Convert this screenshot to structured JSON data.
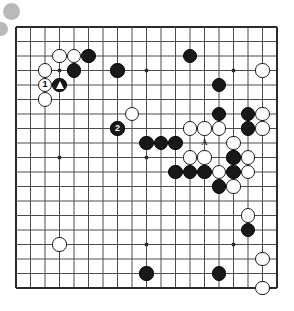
{
  "board": {
    "name": "go-board",
    "size": 19,
    "origin_x": 16,
    "origin_y": 27,
    "spacing": 14.5,
    "line_color": "#4c4c4c",
    "border_color": "#2b2b2b",
    "background_color": "#ffffff",
    "star_points": [
      [
        4,
        4
      ],
      [
        10,
        4
      ],
      [
        16,
        4
      ],
      [
        4,
        10
      ],
      [
        10,
        10
      ],
      [
        16,
        10
      ],
      [
        4,
        16
      ],
      [
        10,
        16
      ],
      [
        16,
        16
      ]
    ]
  },
  "decor": {
    "blob_color": "#b9b9b9",
    "blobs": [
      {
        "name": "decor-circle-1"
      },
      {
        "name": "decor-circle-2"
      }
    ]
  },
  "stones": [
    {
      "color": "white",
      "col": 4,
      "row": 3,
      "label": ""
    },
    {
      "color": "white",
      "col": 5,
      "row": 3,
      "label": ""
    },
    {
      "color": "black",
      "col": 6,
      "row": 3,
      "label": ""
    },
    {
      "color": "black",
      "col": 13,
      "row": 3,
      "label": ""
    },
    {
      "color": "white",
      "col": 3,
      "row": 4,
      "label": ""
    },
    {
      "color": "black",
      "col": 5,
      "row": 4,
      "label": ""
    },
    {
      "color": "black",
      "col": 8,
      "row": 4,
      "label": ""
    },
    {
      "color": "black",
      "col": 15,
      "row": 5,
      "label": ""
    },
    {
      "color": "white",
      "col": 18,
      "row": 4,
      "label": ""
    },
    {
      "color": "white",
      "col": 3,
      "row": 5,
      "label": "1"
    },
    {
      "color": "black",
      "col": 4,
      "row": 5,
      "label": "",
      "mark": "triangle"
    },
    {
      "color": "white",
      "col": 3,
      "row": 6,
      "label": ""
    },
    {
      "color": "white",
      "col": 9,
      "row": 7,
      "label": ""
    },
    {
      "color": "black",
      "col": 15,
      "row": 7,
      "label": ""
    },
    {
      "color": "black",
      "col": 17,
      "row": 7,
      "label": ""
    },
    {
      "color": "white",
      "col": 18,
      "row": 7,
      "label": ""
    },
    {
      "color": "black",
      "col": 8,
      "row": 8,
      "label": "2"
    },
    {
      "color": "white",
      "col": 13,
      "row": 8,
      "label": ""
    },
    {
      "color": "white",
      "col": 14,
      "row": 8,
      "label": ""
    },
    {
      "color": "white",
      "col": 15,
      "row": 8,
      "label": ""
    },
    {
      "color": "black",
      "col": 17,
      "row": 8,
      "label": ""
    },
    {
      "color": "white",
      "col": 18,
      "row": 8,
      "label": ""
    },
    {
      "color": "black",
      "col": 10,
      "row": 9,
      "label": ""
    },
    {
      "color": "black",
      "col": 11,
      "row": 9,
      "label": ""
    },
    {
      "color": "black",
      "col": 12,
      "row": 9,
      "label": ""
    },
    {
      "color": "white",
      "col": 16,
      "row": 9,
      "label": ""
    },
    {
      "color": "white",
      "col": 13,
      "row": 10,
      "label": ""
    },
    {
      "color": "white",
      "col": 14,
      "row": 10,
      "label": ""
    },
    {
      "color": "black",
      "col": 16,
      "row": 10,
      "label": ""
    },
    {
      "color": "white",
      "col": 17,
      "row": 10,
      "label": ""
    },
    {
      "color": "black",
      "col": 12,
      "row": 11,
      "label": ""
    },
    {
      "color": "black",
      "col": 13,
      "row": 11,
      "label": ""
    },
    {
      "color": "black",
      "col": 14,
      "row": 11,
      "label": ""
    },
    {
      "color": "white",
      "col": 15,
      "row": 11,
      "label": ""
    },
    {
      "color": "black",
      "col": 16,
      "row": 11,
      "label": ""
    },
    {
      "color": "white",
      "col": 17,
      "row": 11,
      "label": ""
    },
    {
      "color": "black",
      "col": 15,
      "row": 12,
      "label": ""
    },
    {
      "color": "white",
      "col": 16,
      "row": 12,
      "label": ""
    },
    {
      "color": "white",
      "col": 17,
      "row": 14,
      "label": ""
    },
    {
      "color": "white",
      "col": 4,
      "row": 16,
      "label": ""
    },
    {
      "color": "black",
      "col": 17,
      "row": 15,
      "label": ""
    },
    {
      "color": "black",
      "col": 10,
      "row": 18,
      "label": ""
    },
    {
      "color": "black",
      "col": 15,
      "row": 18,
      "label": ""
    },
    {
      "color": "white",
      "col": 18,
      "row": 17,
      "label": ""
    },
    {
      "color": "white",
      "col": 18,
      "row": 19,
      "label": ""
    }
  ],
  "markers": [
    {
      "name": "point-label-a",
      "text": "A",
      "col": 14,
      "row": 9
    }
  ]
}
